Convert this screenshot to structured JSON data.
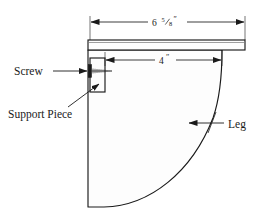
{
  "diagram": {
    "type": "technical-drawing",
    "background_color": "#ffffff",
    "line_color": "#1a1a1a",
    "fill_color": "#fdfdfd",
    "dimensions": [
      {
        "id": "overall-width",
        "value": "6",
        "fraction_numerator": "5",
        "fraction_denominator": "8",
        "unit": "″",
        "full_text": "6⅝″",
        "span_start_x": 90,
        "span_end_x": 245,
        "y": 22,
        "measures": "tabletop overall width"
      },
      {
        "id": "leg-offset-width",
        "value": "4",
        "fraction_numerator": "",
        "fraction_denominator": "",
        "unit": "″",
        "full_text": "4″",
        "span_start_x": 105,
        "span_end_x": 222,
        "y": 60,
        "measures": "support piece to leg curve start"
      }
    ],
    "callouts": [
      {
        "id": "screw",
        "label": "Screw",
        "label_x": 14,
        "label_y": 75,
        "leader_from_x": 53,
        "leader_from_y": 71,
        "leader_to_x": 88,
        "leader_to_y": 71,
        "arrow_direction": "right"
      },
      {
        "id": "support-piece",
        "label": "Support Piece",
        "label_x": 8,
        "label_y": 118,
        "leader_from_x": 68,
        "leader_from_y": 107,
        "leader_to_x": 99,
        "leader_to_y": 84,
        "arrow_direction": "up-right"
      },
      {
        "id": "leg",
        "label": "Leg",
        "label_x": 228,
        "label_y": 128,
        "leader_from_x": 224,
        "leader_from_y": 123,
        "leader_to_x": 190,
        "leader_to_y": 123,
        "arrow_direction": "left"
      }
    ],
    "parts": [
      {
        "id": "tabletop",
        "name": "Tabletop",
        "shape": "rectangle",
        "x": 88,
        "y": 40,
        "width": 157,
        "height": 10
      },
      {
        "id": "support-piece-block",
        "name": "Support Piece",
        "shape": "rectangle",
        "x": 90,
        "y": 58,
        "width": 15,
        "height": 34
      },
      {
        "id": "screw-fastener",
        "name": "Screw",
        "shape": "screw",
        "head_x": 90,
        "head_y": 71,
        "shaft_length": 22
      },
      {
        "id": "leg-panel",
        "name": "Leg",
        "shape": "curved-panel",
        "left_edge_x": 88,
        "top_y": 50,
        "bottom_y": 207,
        "curve_top_x": 222,
        "curve_top_y": 50,
        "bottom_right_x": 150
      }
    ]
  }
}
